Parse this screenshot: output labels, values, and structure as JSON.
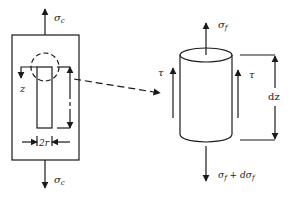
{
  "diagram": {
    "colors": {
      "line": "#1a1a1a",
      "background": "#ffffff",
      "text": "#222222"
    },
    "left_panel": {
      "top_stress_label": {
        "symbol": "σ",
        "subscript": "c"
      },
      "bottom_stress_label": {
        "symbol": "σ",
        "subscript": "c"
      },
      "axis_label": "z",
      "radius_label": "2r"
    },
    "connector": {
      "style": "dashed-arrow",
      "from": "fiber-end-detail-circle",
      "to": "fiber-element"
    },
    "right_panel": {
      "top_stress_label": {
        "symbol": "σ",
        "subscript": "f"
      },
      "bottom_stress_label": {
        "text": "σ",
        "subscript": "f",
        "suffix": " + dσ",
        "suffix_subscript": "f"
      },
      "shear_label_left": "τ",
      "shear_label_right": "τ",
      "length_label": "dz"
    }
  }
}
